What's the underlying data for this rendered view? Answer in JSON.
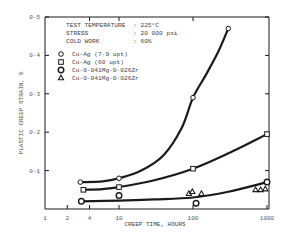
{
  "chart_data": {
    "type": "line",
    "title": "",
    "xlabel": "CREEP TIME, HOURS",
    "ylabel": "PLASTIC CREEP STRAIN, %",
    "xscale": "log",
    "xlim": [
      1,
      1000
    ],
    "ylim": [
      0,
      0.5
    ],
    "x_ticks": [
      {
        "value": 1,
        "label": "1"
      },
      {
        "value": 2,
        "label": "2"
      },
      {
        "value": 4,
        "label": "4"
      },
      {
        "value": 10,
        "label": "10"
      },
      {
        "value": 100,
        "label": "100"
      },
      {
        "value": 1000,
        "label": "1000"
      }
    ],
    "y_ticks": [
      {
        "value": 0.1,
        "label": "0·1"
      },
      {
        "value": 0.2,
        "label": "0·2"
      },
      {
        "value": 0.3,
        "label": "0·3"
      },
      {
        "value": 0.4,
        "label": "0·4"
      },
      {
        "value": 0.5,
        "label": "0·5"
      }
    ],
    "grid": false,
    "legend_position": "upper-left",
    "conditions": [
      {
        "label": "TEST TEMPERATURE",
        "value": ": 225°C"
      },
      {
        "label": "STRESS",
        "value": ": 20 000 psi"
      },
      {
        "label": "COLD WORK",
        "value": ": 60%"
      }
    ],
    "series": [
      {
        "name": "Cu-Ag (7·9 opt)",
        "marker": "circle",
        "points": [
          [
            3,
            0.07
          ],
          [
            10,
            0.08
          ],
          [
            100,
            0.29
          ],
          [
            300,
            0.47
          ]
        ],
        "curve": [
          [
            3,
            0.07
          ],
          [
            6,
            0.072
          ],
          [
            10,
            0.08
          ],
          [
            20,
            0.1
          ],
          [
            40,
            0.14
          ],
          [
            70,
            0.21
          ],
          [
            100,
            0.29
          ],
          [
            150,
            0.35
          ],
          [
            220,
            0.41
          ],
          [
            300,
            0.47
          ]
        ]
      },
      {
        "name": "Cu-Ag (60 opt)",
        "marker": "square",
        "points": [
          [
            3.3,
            0.05
          ],
          [
            10,
            0.057
          ],
          [
            100,
            0.105
          ],
          [
            1000,
            0.195
          ]
        ],
        "curve": [
          [
            3.3,
            0.05
          ],
          [
            6,
            0.052
          ],
          [
            10,
            0.057
          ],
          [
            30,
            0.075
          ],
          [
            100,
            0.105
          ],
          [
            300,
            0.145
          ],
          [
            1000,
            0.195
          ]
        ]
      },
      {
        "name": "Cu-0·041Mg-0·026Zr",
        "marker": "open-circle",
        "points": [
          [
            3.1,
            0.02
          ],
          [
            10,
            0.035
          ],
          [
            110,
            0.015
          ],
          [
            1000,
            0.07
          ]
        ],
        "curve": [
          [
            3.1,
            0.02
          ],
          [
            10,
            0.022
          ],
          [
            30,
            0.025
          ],
          [
            100,
            0.03
          ],
          [
            300,
            0.045
          ],
          [
            1000,
            0.07
          ]
        ]
      },
      {
        "name": "Cu-0·041Mg-0·026Zr",
        "marker": "triangle",
        "points": [
          [
            88,
            0.04
          ],
          [
            98,
            0.045
          ],
          [
            130,
            0.04
          ],
          [
            700,
            0.05
          ],
          [
            820,
            0.05
          ],
          [
            950,
            0.052
          ]
        ]
      }
    ]
  }
}
